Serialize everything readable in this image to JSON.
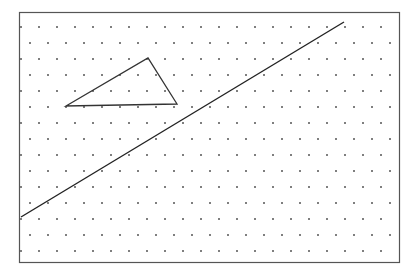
{
  "diagram": {
    "type": "isometric dot grid with triangle and line",
    "frame": {
      "x": 19,
      "y": 12,
      "width": 380,
      "height": 250,
      "stroke": "#555555"
    },
    "dot_grid": {
      "origin_x": 21,
      "origin_y": 27,
      "dx": 18,
      "dy": 16,
      "row_offset": 9,
      "rows": 15,
      "cols": 22,
      "radius": 1,
      "color": "#555555"
    },
    "triangle": {
      "points": [
        [
          66,
          106
        ],
        [
          148,
          58
        ],
        [
          177,
          104
        ]
      ],
      "stroke": "#333333",
      "stroke_width": 1.3
    },
    "line": {
      "x1": 21,
      "y1": 217,
      "x2": 344,
      "y2": 22,
      "stroke": "#222222",
      "stroke_width": 1.4
    }
  }
}
